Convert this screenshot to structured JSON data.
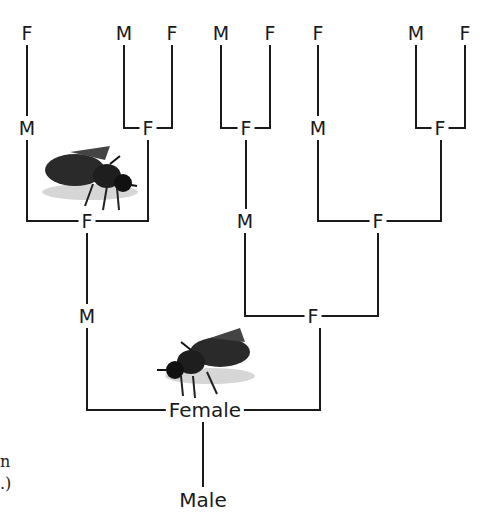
{
  "diagram": {
    "nodes": [
      {
        "id": "r1a",
        "label": "F",
        "x": 27,
        "y": 33
      },
      {
        "id": "r1b",
        "label": "M",
        "x": 124,
        "y": 33
      },
      {
        "id": "r1c",
        "label": "F",
        "x": 172,
        "y": 33
      },
      {
        "id": "r1d",
        "label": "M",
        "x": 221,
        "y": 33
      },
      {
        "id": "r1e",
        "label": "F",
        "x": 270,
        "y": 33
      },
      {
        "id": "r1f",
        "label": "F",
        "x": 318,
        "y": 33
      },
      {
        "id": "r1g",
        "label": "M",
        "x": 416,
        "y": 33
      },
      {
        "id": "r1h",
        "label": "F",
        "x": 465,
        "y": 33
      },
      {
        "id": "r2a",
        "label": "M",
        "x": 27,
        "y": 128
      },
      {
        "id": "r2b",
        "label": "F",
        "x": 148,
        "y": 128
      },
      {
        "id": "r2c",
        "label": "F",
        "x": 246,
        "y": 128
      },
      {
        "id": "r2d",
        "label": "M",
        "x": 318,
        "y": 128
      },
      {
        "id": "r2e",
        "label": "F",
        "x": 440,
        "y": 128
      },
      {
        "id": "r3a",
        "label": "F",
        "x": 87,
        "y": 221
      },
      {
        "id": "r3b",
        "label": "M",
        "x": 245,
        "y": 221
      },
      {
        "id": "r3c",
        "label": "F",
        "x": 378,
        "y": 221
      },
      {
        "id": "r4a",
        "label": "M",
        "x": 87,
        "y": 316
      },
      {
        "id": "r4b",
        "label": "F",
        "x": 313,
        "y": 316
      },
      {
        "id": "female",
        "label": "Female",
        "x": 205,
        "y": 410
      },
      {
        "id": "male",
        "label": "Male",
        "x": 203,
        "y": 500
      }
    ],
    "images": [
      {
        "name": "bee-image-upper",
        "x": 35,
        "y": 140
      },
      {
        "name": "bee-image-lower",
        "x": 155,
        "y": 328
      }
    ],
    "edge_text_fragments": [
      "n",
      ".)"
    ]
  }
}
